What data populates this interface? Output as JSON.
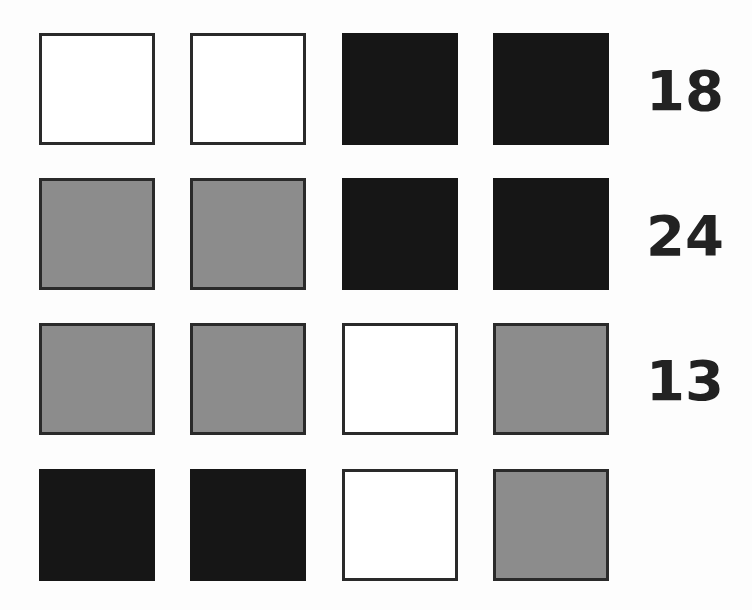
{
  "puzzle": {
    "colors": {
      "white": "#ffffff",
      "gray": "#8c8c8c",
      "black": "#161616"
    },
    "rows": [
      {
        "cells": [
          "white",
          "white",
          "black",
          "black"
        ],
        "value": "18"
      },
      {
        "cells": [
          "gray",
          "gray",
          "black",
          "black"
        ],
        "value": "24"
      },
      {
        "cells": [
          "gray",
          "gray",
          "white",
          "gray"
        ],
        "value": "13"
      },
      {
        "cells": [
          "black",
          "black",
          "white",
          "gray"
        ],
        "value": ""
      }
    ]
  }
}
